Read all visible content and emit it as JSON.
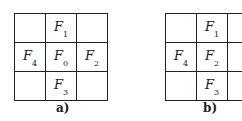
{
  "panels": [
    {
      "id": "a",
      "caption": "a)",
      "cells": [
        [
          "",
          "F|1",
          ""
        ],
        [
          "F|4",
          "F|0",
          "F|2"
        ],
        [
          "",
          "F|3",
          ""
        ]
      ]
    },
    {
      "id": "b",
      "caption": "b)",
      "cells": [
        [
          "",
          "F|1",
          ""
        ],
        [
          "F|4",
          "F|2",
          ""
        ],
        [
          "",
          "F|3",
          ""
        ]
      ]
    }
  ],
  "colors": {
    "line": "#222222",
    "text": "#222222",
    "background": "#ffffff"
  }
}
